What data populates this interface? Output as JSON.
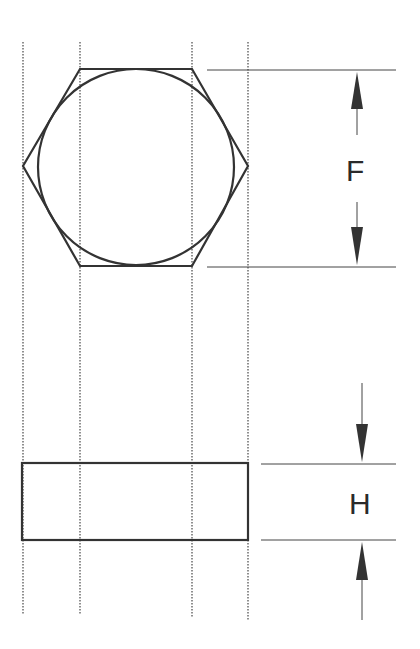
{
  "diagram": {
    "labels": {
      "across_flats": "F",
      "height": "H"
    },
    "stroke_color": "#333333",
    "guide_color": "#555555"
  }
}
